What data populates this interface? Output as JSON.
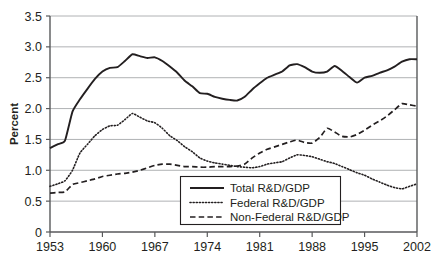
{
  "chart_data": {
    "type": "line",
    "title": "",
    "subtitle": "",
    "xlabel": "",
    "ylabel": "Percent",
    "xlim": [
      1953,
      2002
    ],
    "ylim": [
      0,
      3.5
    ],
    "grid": true,
    "grid_axis": "y",
    "legend_position": "inside-bottom-center",
    "x_tick_labels": [
      "1953",
      "1960",
      "1967",
      "1974",
      "1981",
      "1988",
      "1995",
      "2002"
    ],
    "x_ticks": [
      1953,
      1960,
      1967,
      1974,
      1981,
      1988,
      1995,
      2002
    ],
    "y_tick_labels": [
      "0",
      "0.5",
      "1.0",
      "1.5",
      "2.0",
      "2.5",
      "3.0",
      "3.5"
    ],
    "y_ticks": [
      0,
      0.5,
      1.0,
      1.5,
      2.0,
      2.5,
      3.0,
      3.5
    ],
    "x": [
      1953,
      1954,
      1955,
      1956,
      1957,
      1958,
      1959,
      1960,
      1961,
      1962,
      1963,
      1964,
      1965,
      1966,
      1967,
      1968,
      1969,
      1970,
      1971,
      1972,
      1973,
      1974,
      1975,
      1976,
      1977,
      1978,
      1979,
      1980,
      1981,
      1982,
      1983,
      1984,
      1985,
      1986,
      1987,
      1988,
      1989,
      1990,
      1991,
      1992,
      1993,
      1994,
      1995,
      1996,
      1997,
      1998,
      1999,
      2000,
      2001,
      2002
    ],
    "series": [
      {
        "name": "Total R&D/GDP",
        "style": "solid",
        "color": "#231f20",
        "values": [
          1.36,
          1.42,
          1.48,
          1.95,
          2.15,
          2.32,
          2.48,
          2.6,
          2.66,
          2.67,
          2.77,
          2.88,
          2.85,
          2.82,
          2.83,
          2.77,
          2.68,
          2.58,
          2.45,
          2.36,
          2.25,
          2.24,
          2.19,
          2.16,
          2.14,
          2.13,
          2.19,
          2.31,
          2.41,
          2.5,
          2.55,
          2.6,
          2.7,
          2.72,
          2.67,
          2.6,
          2.58,
          2.6,
          2.69,
          2.61,
          2.51,
          2.42,
          2.5,
          2.53,
          2.58,
          2.62,
          2.68,
          2.76,
          2.8,
          2.8
        ]
      },
      {
        "name": "Federal R&D/GDP",
        "style": "dotted",
        "color": "#231f20",
        "values": [
          0.74,
          0.78,
          0.83,
          1.0,
          1.28,
          1.42,
          1.56,
          1.66,
          1.72,
          1.73,
          1.82,
          1.92,
          1.86,
          1.8,
          1.77,
          1.68,
          1.56,
          1.48,
          1.38,
          1.3,
          1.2,
          1.15,
          1.12,
          1.1,
          1.08,
          1.06,
          1.05,
          1.04,
          1.06,
          1.1,
          1.12,
          1.14,
          1.2,
          1.25,
          1.24,
          1.22,
          1.18,
          1.14,
          1.11,
          1.06,
          1.01,
          0.96,
          0.92,
          0.86,
          0.81,
          0.76,
          0.72,
          0.7,
          0.74,
          0.78
        ]
      },
      {
        "name": "Non-Federal R&D/GDP",
        "style": "dashed",
        "color": "#231f20",
        "values": [
          0.63,
          0.64,
          0.65,
          0.77,
          0.8,
          0.83,
          0.86,
          0.9,
          0.92,
          0.94,
          0.95,
          0.97,
          1.0,
          1.04,
          1.08,
          1.1,
          1.1,
          1.08,
          1.06,
          1.06,
          1.05,
          1.05,
          1.06,
          1.06,
          1.06,
          1.07,
          1.1,
          1.2,
          1.28,
          1.34,
          1.38,
          1.42,
          1.46,
          1.49,
          1.45,
          1.44,
          1.53,
          1.68,
          1.62,
          1.55,
          1.54,
          1.58,
          1.65,
          1.73,
          1.8,
          1.88,
          1.98,
          2.08,
          2.06,
          2.04
        ]
      }
    ]
  },
  "legend": {
    "items": [
      {
        "label": "Total R&D/GDP",
        "style": "solid"
      },
      {
        "label": "Federal R&D/GDP",
        "style": "dotted"
      },
      {
        "label": "Non-Federal R&D/GDP",
        "style": "dashed"
      }
    ]
  },
  "colors": {
    "line": "#231f20",
    "grid": "#a7a9ac",
    "axis": "#58595b",
    "text": "#231f20",
    "background": "#ffffff"
  }
}
